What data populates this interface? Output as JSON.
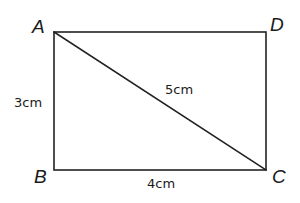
{
  "diagram": {
    "shape": "rectangle",
    "vertices": {
      "A": {
        "label": "A",
        "x": 54,
        "y": 32
      },
      "B": {
        "label": "B",
        "x": 54,
        "y": 170
      },
      "C": {
        "label": "C",
        "x": 266,
        "y": 170
      },
      "D": {
        "label": "D",
        "x": 266,
        "y": 32
      }
    },
    "diagonal": {
      "from": "A",
      "to": "C"
    },
    "measurements": {
      "AB": "3cm",
      "BC": "4cm",
      "AC": "5cm"
    },
    "colors": {
      "line": "#222222",
      "text": "#1a1a1a",
      "background": "#ffffff"
    }
  }
}
